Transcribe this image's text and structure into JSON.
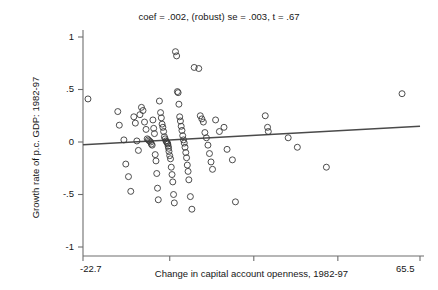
{
  "chart_data": {
    "type": "scatter",
    "title": "coef = .002, (robust) se = .003, t = .67",
    "xlabel": "Change in capital account openness, 1982-97",
    "ylabel": "Growth rate of p.c. GDP: 1982-97",
    "xlim": [
      -22.7,
      65.5
    ],
    "ylim": [
      -1,
      1
    ],
    "grid": false,
    "legend": null,
    "x_tick_labels": [
      "-22.7",
      "65.5"
    ],
    "x_tick_values": [
      -22.7,
      65.5
    ],
    "x_minor_tick_values": [
      0,
      22,
      44
    ],
    "y_tick_labels": [
      "1",
      ".5",
      "0",
      "-.5",
      "-1"
    ],
    "y_tick_values": [
      1,
      0.5,
      0,
      -0.5,
      -1
    ],
    "marker": "open-circle",
    "marker_color": "#3a3a3a",
    "marker_radius_px": 3,
    "fit_line": {
      "label": "regression line",
      "slope": 0.002,
      "intercept": 0.02,
      "color": "#4a4a4a",
      "x_start": -22.7,
      "x_end": 65.5
    },
    "stats": {
      "coef": 0.002,
      "robust_se": 0.003,
      "t": 0.67
    },
    "points": [
      [
        -21.4,
        0.41
      ],
      [
        -13.6,
        0.29
      ],
      [
        -13.2,
        0.16
      ],
      [
        -12.0,
        0.02
      ],
      [
        -11.5,
        -0.21
      ],
      [
        -10.8,
        -0.33
      ],
      [
        -10.2,
        -0.47
      ],
      [
        -9.4,
        0.24
      ],
      [
        -9.0,
        0.18
      ],
      [
        -8.6,
        0.01
      ],
      [
        -8.2,
        -0.08
      ],
      [
        -7.8,
        0.26
      ],
      [
        -7.4,
        0.33
      ],
      [
        -7.0,
        0.3
      ],
      [
        -6.6,
        0.19
      ],
      [
        -6.2,
        0.12
      ],
      [
        -5.9,
        0.03
      ],
      [
        -5.6,
        0.02
      ],
      [
        -5.3,
        0.01
      ],
      [
        -5.0,
        0.0
      ],
      [
        -4.8,
        -0.02
      ],
      [
        -4.6,
        -0.03
      ],
      [
        -4.4,
        0.21
      ],
      [
        -4.2,
        0.13
      ],
      [
        -4.0,
        0.08
      ],
      [
        -3.8,
        -0.12
      ],
      [
        -3.6,
        -0.18
      ],
      [
        -3.4,
        -0.3
      ],
      [
        -3.2,
        -0.44
      ],
      [
        -3.0,
        -0.55
      ],
      [
        -2.7,
        0.39
      ],
      [
        -2.4,
        0.28
      ],
      [
        -2.2,
        0.23
      ],
      [
        -2.0,
        0.17
      ],
      [
        -1.8,
        0.14
      ],
      [
        -1.6,
        0.1
      ],
      [
        -1.4,
        0.05
      ],
      [
        -1.2,
        0.03
      ],
      [
        -1.0,
        0.01
      ],
      [
        -0.8,
        0.0
      ],
      [
        -0.6,
        -0.01
      ],
      [
        -0.5,
        -0.02
      ],
      [
        -0.4,
        -0.04
      ],
      [
        -0.3,
        -0.06
      ],
      [
        -0.2,
        -0.09
      ],
      [
        0.0,
        -0.13
      ],
      [
        0.2,
        -0.16
      ],
      [
        0.4,
        -0.24
      ],
      [
        0.6,
        -0.31
      ],
      [
        0.8,
        -0.38
      ],
      [
        1.0,
        -0.5
      ],
      [
        1.2,
        -0.58
      ],
      [
        1.5,
        0.86
      ],
      [
        1.8,
        0.82
      ],
      [
        2.0,
        0.48
      ],
      [
        2.2,
        0.47
      ],
      [
        2.4,
        0.36
      ],
      [
        2.6,
        0.24
      ],
      [
        2.8,
        0.2
      ],
      [
        3.0,
        0.15
      ],
      [
        3.2,
        0.11
      ],
      [
        3.4,
        0.06
      ],
      [
        3.6,
        0.02
      ],
      [
        3.8,
        -0.01
      ],
      [
        4.0,
        -0.05
      ],
      [
        4.2,
        -0.1
      ],
      [
        4.4,
        -0.15
      ],
      [
        4.6,
        -0.22
      ],
      [
        4.8,
        -0.28
      ],
      [
        5.0,
        -0.36
      ],
      [
        5.4,
        -0.52
      ],
      [
        5.8,
        -0.64
      ],
      [
        6.4,
        0.71
      ],
      [
        7.6,
        0.7
      ],
      [
        8.0,
        0.25
      ],
      [
        8.4,
        0.22
      ],
      [
        8.8,
        0.19
      ],
      [
        9.2,
        0.09
      ],
      [
        9.6,
        0.04
      ],
      [
        10.0,
        -0.03
      ],
      [
        10.4,
        -0.11
      ],
      [
        10.8,
        -0.19
      ],
      [
        11.2,
        -0.26
      ],
      [
        12.0,
        0.21
      ],
      [
        13.0,
        0.1
      ],
      [
        14.2,
        0.14
      ],
      [
        15.0,
        -0.07
      ],
      [
        16.4,
        -0.17
      ],
      [
        17.2,
        -0.57
      ],
      [
        25.0,
        0.25
      ],
      [
        25.6,
        0.14
      ],
      [
        25.8,
        0.1
      ],
      [
        31.0,
        0.04
      ],
      [
        33.4,
        -0.05
      ],
      [
        41.0,
        -0.24
      ],
      [
        60.8,
        0.46
      ]
    ]
  }
}
